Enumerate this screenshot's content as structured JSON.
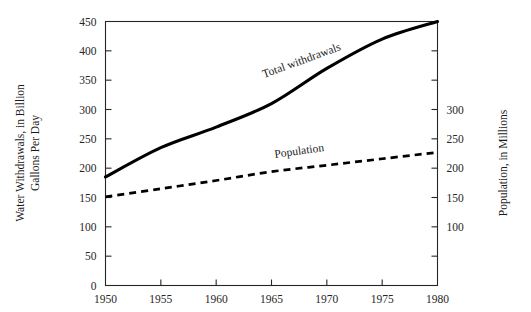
{
  "chart_data": {
    "type": "line",
    "title": "",
    "xlabel": "",
    "ylabel": "Water Withdrawals, in Billion Gallons Per Day",
    "y2label": "Population, in Millions",
    "grid": false,
    "legend_position": "inline-annotations",
    "x": [
      1950,
      1955,
      1960,
      1965,
      1970,
      1975,
      1980
    ],
    "xlim": [
      1950,
      1980
    ],
    "xticks": [
      1950,
      1955,
      1960,
      1965,
      1970,
      1975,
      1980
    ],
    "xtick_labels": [
      "1950",
      "1955",
      "1960",
      "1965",
      "1970",
      "1975",
      "1980"
    ],
    "ylim": [
      0,
      450
    ],
    "yticks": [
      0,
      50,
      100,
      150,
      200,
      250,
      300,
      350,
      400,
      450
    ],
    "ytick_labels": [
      "0",
      "50",
      "100",
      "150",
      "200",
      "250",
      "300",
      "350",
      "400",
      "450"
    ],
    "y2lim": [
      0,
      450
    ],
    "y2ticks": [
      50,
      100,
      150,
      200,
      250,
      300,
      350,
      400
    ],
    "y2tick_labels": [
      "",
      "100",
      "150",
      "200",
      "250",
      "300",
      "",
      ""
    ],
    "series": [
      {
        "name": "Total withdrawals",
        "axis": "left",
        "style": "solid",
        "label_text": "Total withdrawals",
        "values": [
          185,
          235,
          270,
          310,
          370,
          420,
          450
        ]
      },
      {
        "name": "Population",
        "axis": "right",
        "style": "dashed",
        "label_text": "Population",
        "values": [
          151,
          165,
          179,
          194,
          205,
          216,
          227
        ]
      }
    ],
    "annotations": [
      {
        "text": "Total withdrawals",
        "rotation": -20
      },
      {
        "text": "Population",
        "rotation": -8
      }
    ],
    "colors": {
      "ink": "#000000",
      "axis": "#262626",
      "background": "#ffffff"
    }
  },
  "labels": {
    "left_axis_title_line1": "Water Withdrawals, in Billion",
    "left_axis_title_line2": "Gallons Per Day",
    "right_axis_title": "Population, in Millions"
  }
}
